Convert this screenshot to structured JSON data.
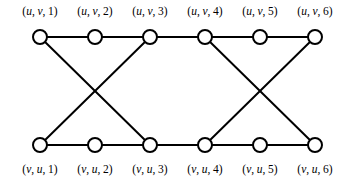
{
  "figure": {
    "background_color": "#ffffff",
    "stroke_color": "#000000",
    "node_fill_color": "#ffffff",
    "node_radius": 7,
    "edge_width": 2,
    "node_stroke_width": 2
  },
  "chart_data": {
    "type": "diagram",
    "title": "",
    "layout": "two-row vertex arrangement, six columns",
    "top_row_y": 37,
    "bottom_row_y": 145,
    "column_x": [
      40,
      95,
      150,
      205,
      260,
      315
    ],
    "nodes": [
      {
        "id": "u1",
        "row": "top",
        "column": 1,
        "x": 40,
        "y": 37,
        "label": "(u, v, 1)"
      },
      {
        "id": "u2",
        "row": "top",
        "column": 2,
        "x": 95,
        "y": 37,
        "label": "(u, v, 2)"
      },
      {
        "id": "u3",
        "row": "top",
        "column": 3,
        "x": 150,
        "y": 37,
        "label": "(u, v, 3)"
      },
      {
        "id": "u4",
        "row": "top",
        "column": 4,
        "x": 205,
        "y": 37,
        "label": "(u, v, 4)"
      },
      {
        "id": "u5",
        "row": "top",
        "column": 5,
        "x": 260,
        "y": 37,
        "label": "(u, v, 5)"
      },
      {
        "id": "u6",
        "row": "top",
        "column": 6,
        "x": 315,
        "y": 37,
        "label": "(u, v, 6)"
      },
      {
        "id": "v1",
        "row": "bottom",
        "column": 1,
        "x": 40,
        "y": 145,
        "label": "(v, u, 1)"
      },
      {
        "id": "v2",
        "row": "bottom",
        "column": 2,
        "x": 95,
        "y": 145,
        "label": "(v, u, 2)"
      },
      {
        "id": "v3",
        "row": "bottom",
        "column": 3,
        "x": 150,
        "y": 145,
        "label": "(v, u, 3)"
      },
      {
        "id": "v4",
        "row": "bottom",
        "column": 4,
        "x": 205,
        "y": 145,
        "label": "(v, u, 4)"
      },
      {
        "id": "v5",
        "row": "bottom",
        "column": 5,
        "x": 260,
        "y": 145,
        "label": "(v, u, 5)"
      },
      {
        "id": "v6",
        "row": "bottom",
        "column": 6,
        "x": 315,
        "y": 145,
        "label": "(v, u, 6)"
      }
    ],
    "edges": [
      {
        "from": "u1",
        "to": "u2",
        "kind": "horizontal-top"
      },
      {
        "from": "u2",
        "to": "u3",
        "kind": "horizontal-top"
      },
      {
        "from": "u3",
        "to": "u4",
        "kind": "horizontal-top"
      },
      {
        "from": "u4",
        "to": "u5",
        "kind": "horizontal-top"
      },
      {
        "from": "u5",
        "to": "u6",
        "kind": "horizontal-top"
      },
      {
        "from": "v1",
        "to": "v2",
        "kind": "horizontal-bottom"
      },
      {
        "from": "v2",
        "to": "v3",
        "kind": "horizontal-bottom"
      },
      {
        "from": "v3",
        "to": "v4",
        "kind": "horizontal-bottom"
      },
      {
        "from": "v4",
        "to": "v5",
        "kind": "horizontal-bottom"
      },
      {
        "from": "v5",
        "to": "v6",
        "kind": "horizontal-bottom"
      },
      {
        "from": "u1",
        "to": "v3",
        "kind": "diagonal-left-cross"
      },
      {
        "from": "u3",
        "to": "v1",
        "kind": "diagonal-left-cross"
      },
      {
        "from": "u4",
        "to": "v6",
        "kind": "diagonal-right-cross"
      },
      {
        "from": "u6",
        "to": "v4",
        "kind": "diagonal-right-cross"
      }
    ],
    "top_labels": [
      "(u, v, 1)",
      "(u, v, 2)",
      "(u, v, 3)",
      "(u, v, 4)",
      "(u, v, 5)",
      "(u, v, 6)"
    ],
    "bottom_labels": [
      "(v, u, 1)",
      "(v, u, 2)",
      "(v, u, 3)",
      "(v, u, 4)",
      "(v, u, 5)",
      "(v, u, 6)"
    ],
    "label_parts": {
      "top": [
        {
          "first": "u",
          "second": "v",
          "index": "1"
        },
        {
          "first": "u",
          "second": "v",
          "index": "2"
        },
        {
          "first": "u",
          "second": "v",
          "index": "3"
        },
        {
          "first": "u",
          "second": "v",
          "index": "4"
        },
        {
          "first": "u",
          "second": "v",
          "index": "5"
        },
        {
          "first": "u",
          "second": "v",
          "index": "6"
        }
      ],
      "bottom": [
        {
          "first": "v",
          "second": "u",
          "index": "1"
        },
        {
          "first": "v",
          "second": "u",
          "index": "2"
        },
        {
          "first": "v",
          "second": "u",
          "index": "3"
        },
        {
          "first": "v",
          "second": "u",
          "index": "4"
        },
        {
          "first": "v",
          "second": "u",
          "index": "5"
        },
        {
          "first": "v",
          "second": "u",
          "index": "6"
        }
      ]
    }
  }
}
